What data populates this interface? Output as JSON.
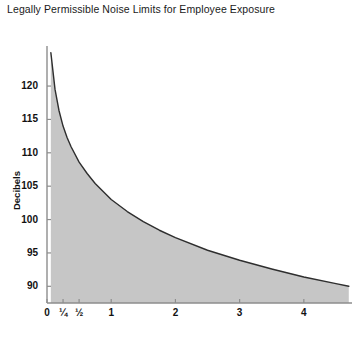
{
  "chart_data": {
    "type": "area",
    "title": "Legally Permissible Noise Limits for Employee Exposure",
    "xlabel": "",
    "ylabel": "Decibels",
    "xlim": [
      0,
      4.75
    ],
    "ylim": [
      87.5,
      126
    ],
    "grid": false,
    "legend": null,
    "xticks": [
      {
        "value": 0,
        "label": "0"
      },
      {
        "value": 0.25,
        "label": "¼"
      },
      {
        "value": 0.5,
        "label": "½"
      },
      {
        "value": 1,
        "label": "1"
      },
      {
        "value": 2,
        "label": "2"
      },
      {
        "value": 3,
        "label": "3"
      },
      {
        "value": 4,
        "label": "4"
      }
    ],
    "yticks": [
      {
        "value": 90,
        "label": "90"
      },
      {
        "value": 95,
        "label": "95"
      },
      {
        "value": 100,
        "label": "100"
      },
      {
        "value": 105,
        "label": "105"
      },
      {
        "value": 110,
        "label": "110"
      },
      {
        "value": 115,
        "label": "115"
      },
      {
        "value": 120,
        "label": "120"
      }
    ],
    "series": [
      {
        "name": "Permissible noise limit",
        "x": [
          0.06,
          0.125,
          0.1875,
          0.25,
          0.3125,
          0.375,
          0.5,
          0.625,
          0.75,
          1.0,
          1.25,
          1.5,
          1.75,
          2.0,
          2.5,
          3.0,
          3.5,
          4.0,
          4.5,
          4.7
        ],
        "y": [
          125.0,
          119.5,
          116.3,
          114.0,
          112.3,
          110.9,
          108.6,
          106.9,
          105.4,
          103.0,
          101.2,
          99.7,
          98.4,
          97.3,
          95.4,
          93.9,
          92.6,
          91.4,
          90.4,
          90.0
        ],
        "fill_color": "#c6c6c6",
        "line_color": "#2e2e2e"
      }
    ],
    "axis_color": "#8d8d8d"
  },
  "axis_footer": {
    "cut_off_label": ""
  }
}
